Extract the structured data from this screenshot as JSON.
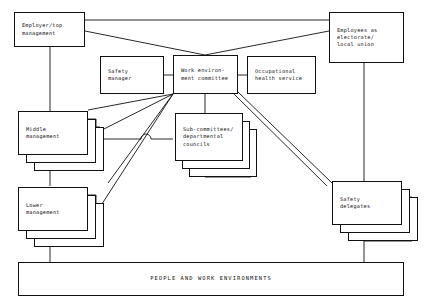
{
  "diagram": {
    "type": "org-flow-diagram",
    "background_color": "#ffffff",
    "line_color": "#111111",
    "nodes": {
      "employer_top_management": {
        "label": "Employer/top\nmanagement",
        "stacked": false
      },
      "employees_electorate": {
        "label": "Employees as\nelectorate/\nlocal union",
        "stacked": false
      },
      "safety_manager": {
        "label": "Safety\nmanager",
        "stacked": false
      },
      "work_environment_committee": {
        "label": "Work environ-\nment committee",
        "stacked": false
      },
      "occupational_health_service": {
        "label": "Occupational\nhealth service",
        "stacked": false
      },
      "middle_management": {
        "label": "Middle\nmanagement",
        "stacked": true,
        "stack_layers": 3
      },
      "sub_committees": {
        "label": "Sub-committees/\ndepartmental\ncouncils",
        "stacked": true,
        "stack_layers": 3
      },
      "lower_management": {
        "label": "Lower\nmanagement",
        "stacked": true,
        "stack_layers": 3
      },
      "safety_delegates": {
        "label": "Safety\ndelegates",
        "stacked": true,
        "stack_layers": 3
      },
      "people_and_work_environments": {
        "label": "PEOPLE AND WORK ENVIRONMENTS",
        "stacked": false
      }
    }
  }
}
